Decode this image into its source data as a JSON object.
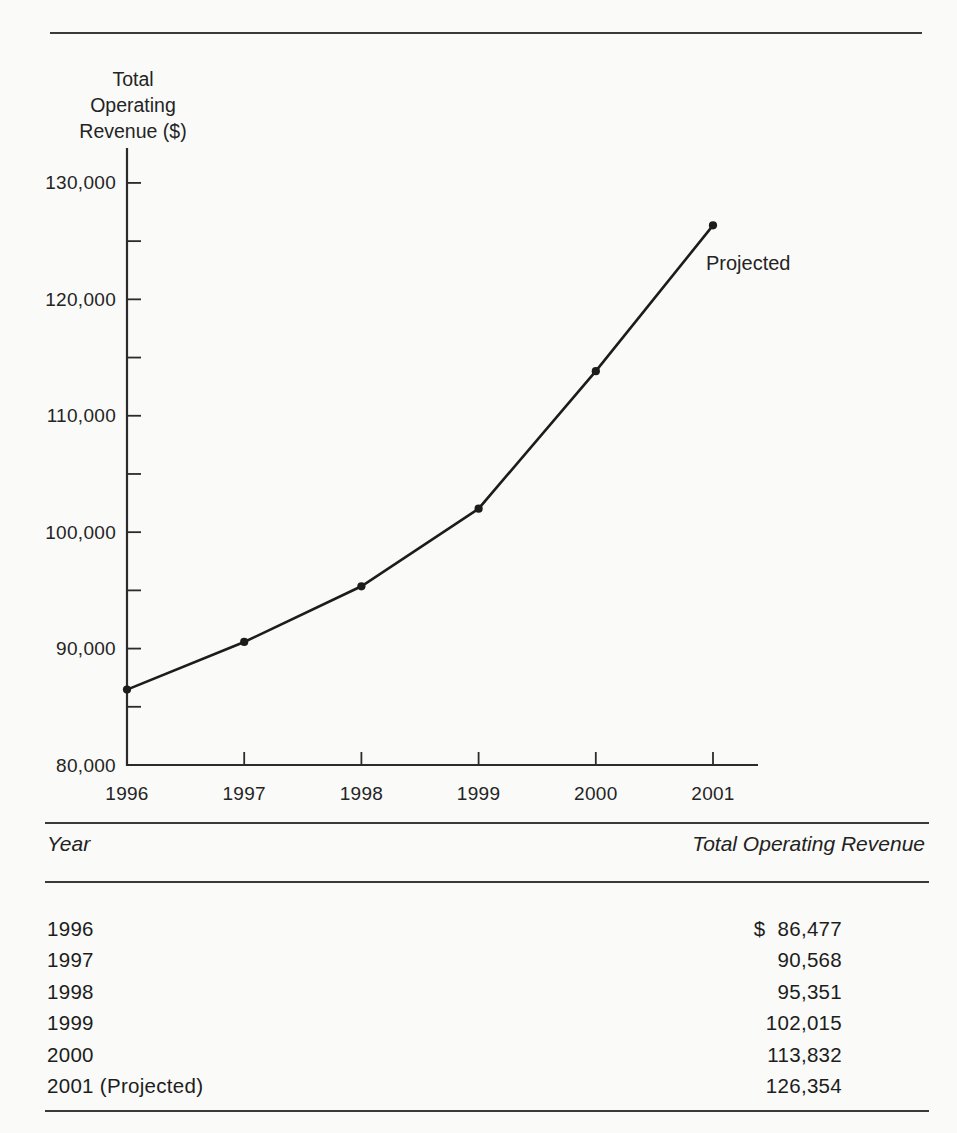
{
  "page": {
    "background": "#fafaf8",
    "ink": "#1d1d1d"
  },
  "chart_data": {
    "type": "line",
    "y_axis_title": "Total Operating Revenue ($)",
    "y_axis_title_lines": [
      "Total",
      "Operating",
      "Revenue ($)"
    ],
    "categories": [
      "1996",
      "1997",
      "1998",
      "1999",
      "2000",
      "2001"
    ],
    "values": [
      86477,
      90568,
      95351,
      102015,
      113832,
      126354
    ],
    "series_name": "Total Operating Revenue",
    "annotation": "Projected",
    "annotation_anchor_category": "2001",
    "ylim": [
      80000,
      133000
    ],
    "y_major_ticks": [
      80000,
      90000,
      100000,
      110000,
      120000,
      130000
    ],
    "y_major_tick_labels": [
      "80,000",
      "90,000",
      "100,000",
      "110,000",
      "120,000",
      "130,000"
    ],
    "y_minor_tick_values": [
      85000,
      95000,
      105000,
      115000,
      125000
    ],
    "grid": false,
    "legend": "none",
    "marker": "filled-circle",
    "line_color": "#1c1c1c"
  },
  "table": {
    "columns": [
      "Year",
      "Total Operating Revenue"
    ],
    "rows": [
      {
        "year": "1996",
        "currency": "$",
        "value": "86,477"
      },
      {
        "year": "1997",
        "currency": "",
        "value": "90,568"
      },
      {
        "year": "1998",
        "currency": "",
        "value": "95,351"
      },
      {
        "year": "1999",
        "currency": "",
        "value": "102,015"
      },
      {
        "year": "2000",
        "currency": "",
        "value": "113,832"
      },
      {
        "year": "2001 (Projected)",
        "currency": "",
        "value": "126,354"
      }
    ]
  }
}
